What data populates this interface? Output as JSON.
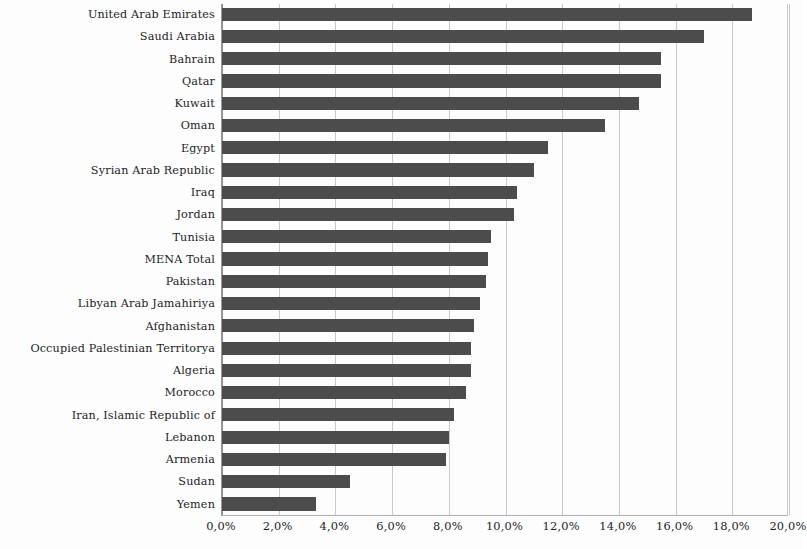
{
  "chart_data": {
    "type": "bar",
    "orientation": "horizontal",
    "title": "",
    "subtitle": "",
    "xlabel": "",
    "ylabel": "",
    "xlim": [
      0,
      20
    ],
    "unit": "%",
    "decimal_separator": ",",
    "grid": true,
    "grid_axis": "x",
    "legend": "none",
    "bar_color": "#4c4c4c",
    "background_color": "#fdfdfd",
    "gridline_color": "#c9c9c9",
    "axis_color": "#8f8f8f",
    "xticks": [
      "0,0%",
      "2,0%",
      "4,0%",
      "6,0%",
      "8,0%",
      "10,0%",
      "12,0%",
      "14,0%",
      "16,0%",
      "18,0%",
      "20,0%"
    ],
    "xtick_values": [
      0,
      2,
      4,
      6,
      8,
      10,
      12,
      14,
      16,
      18,
      20
    ],
    "categories": [
      "United Arab Emirates",
      "Saudi Arabia",
      "Bahrain",
      "Qatar",
      "Kuwait",
      "Oman",
      "Egypt",
      "Syrian Arab Republic",
      "Iraq",
      "Jordan",
      "Tunisia",
      "MENA Total",
      "Pakistan",
      "Libyan Arab Jamahiriya",
      "Afghanistan",
      "Occupied Palestinian Territorya",
      "Algeria",
      "Morocco",
      "Iran, Islamic Republic of",
      "Lebanon",
      "Armenia",
      "Sudan",
      "Yemen"
    ],
    "values": [
      18.7,
      17.0,
      15.5,
      15.5,
      14.7,
      13.5,
      11.5,
      11.0,
      10.4,
      10.3,
      9.5,
      9.4,
      9.3,
      9.1,
      8.9,
      8.8,
      8.8,
      8.6,
      8.2,
      8.0,
      7.9,
      4.5,
      3.3
    ]
  }
}
